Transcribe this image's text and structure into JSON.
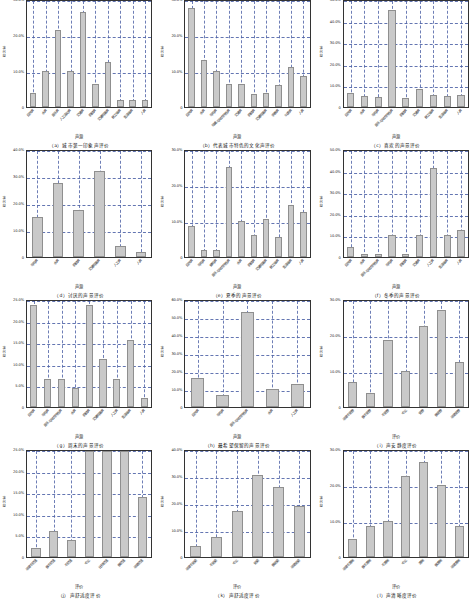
{
  "figure": {
    "bar_color": "#c9c9c9",
    "grid_color": "#4a5fa5",
    "axis_color": "#333333"
  },
  "chart_data": [
    {
      "type": "bar",
      "panel": "a",
      "title": "（a）城市第一印象声评价",
      "xlabel": "声源",
      "ylabel": "百分率",
      "ylim": [
        0,
        30
      ],
      "yticks": [
        0,
        10,
        20,
        30
      ],
      "ytick_labels": [
        "0",
        "10.0%",
        "20.0%",
        "30.0%"
      ],
      "grid": true,
      "categories": [
        "自然声",
        "水声",
        "音乐声",
        "人工活动声",
        "交通声",
        "机械声",
        "交通鸣笛声",
        "施工噪声",
        "生活噪声",
        "人声"
      ],
      "values": [
        4.0,
        10.0,
        21.5,
        10.0,
        26.5,
        6.5,
        12.5,
        2.0,
        2.0,
        2.0
      ]
    },
    {
      "type": "bar",
      "panel": "b",
      "title": "（b）代表城市特色的文化声评价",
      "xlabel": "声源",
      "ylabel": "百分率",
      "ylim": [
        0,
        30
      ],
      "yticks": [
        0,
        10,
        20,
        30
      ],
      "ytick_labels": [
        "0",
        "10.0%",
        "20.0%",
        "30.0%"
      ],
      "grid": true,
      "categories": [
        "自然声",
        "水声",
        "鸟鸣声",
        "戏曲与地方特色声",
        "交通声",
        "机械声",
        "交通鸣笛声",
        "宗教声",
        "叫卖声",
        "人声"
      ],
      "values": [
        27.5,
        13.0,
        10.0,
        6.5,
        6.5,
        3.5,
        4.0,
        6.0,
        11.0,
        8.5
      ]
    },
    {
      "type": "bar",
      "panel": "c",
      "title": "（c）喜欢的声景评价",
      "xlabel": "声源",
      "ylabel": "百分率",
      "ylim": [
        0,
        50
      ],
      "yticks": [
        0,
        10,
        20,
        30,
        40,
        50
      ],
      "ytick_labels": [
        "0",
        "10.0%",
        "20.0%",
        "30.0%",
        "40.0%",
        "50.0%"
      ],
      "grid": true,
      "categories": [
        "自然声",
        "水声",
        "鸟鸣声",
        "音乐与地方特色声",
        "机械声",
        "交通声",
        "施工噪声",
        "生活噪声",
        "人声"
      ],
      "values": [
        6.5,
        5.0,
        4.5,
        45.0,
        4.0,
        8.5,
        5.5,
        5.0,
        5.5
      ]
    },
    {
      "type": "bar",
      "panel": "d",
      "title": "（d）讨厌的声景评价",
      "xlabel": "声源",
      "ylabel": "百分率",
      "ylim": [
        0,
        40
      ],
      "yticks": [
        0,
        10,
        20,
        30,
        40
      ],
      "ytick_labels": [
        "0",
        "10.0%",
        "20.0%",
        "30.0%",
        "40.0%"
      ],
      "grid": true,
      "categories": [
        "鸟鸣声",
        "水声",
        "机械声",
        "交通鸣笛声",
        "人工声",
        "人声"
      ],
      "values": [
        15.0,
        27.5,
        17.5,
        32.0,
        4.0,
        2.0
      ]
    },
    {
      "type": "bar",
      "panel": "e",
      "title": "（e）夏季的声景评价",
      "xlabel": "声源",
      "ylabel": "百分率",
      "ylim": [
        0,
        30
      ],
      "yticks": [
        0,
        10,
        20,
        30
      ],
      "ytick_labels": [
        "0",
        "10.0%",
        "20.0%",
        "30.0%"
      ],
      "grid": true,
      "categories": [
        "自然声",
        "鸟鸣声",
        "蝉鸣声",
        "音乐与地方特色声",
        "水声",
        "机械声",
        "交通鸣笛声",
        "施工噪声",
        "生活噪声",
        "人声"
      ],
      "values": [
        8.5,
        2.0,
        2.0,
        25.0,
        10.0,
        6.0,
        10.5,
        5.5,
        14.5,
        12.5
      ]
    },
    {
      "type": "bar",
      "panel": "f",
      "title": "（f）冬季的声景评价",
      "xlabel": "声源",
      "ylabel": "百分率",
      "ylim": [
        0,
        50
      ],
      "yticks": [
        0,
        10,
        20,
        30,
        40,
        50
      ],
      "ytick_labels": [
        "0",
        "10.0%",
        "20.0%",
        "30.0%",
        "40.0%",
        "50.0%"
      ],
      "grid": true,
      "categories": [
        "自然声",
        "水声",
        "音乐与地方特色声",
        "鸟鸣声",
        "机械声",
        "交通声",
        "人工声",
        "生活噪声",
        "人声"
      ],
      "values": [
        4.5,
        1.5,
        1.5,
        10.0,
        1.5,
        10.0,
        41.0,
        10.0,
        12.5
      ]
    },
    {
      "type": "bar",
      "panel": "g",
      "title": "（g）周末的声景评价",
      "xlabel": "声源",
      "ylabel": "百分率",
      "ylim": [
        0,
        25
      ],
      "yticks": [
        0,
        5,
        10,
        15,
        20,
        25
      ],
      "ytick_labels": [
        "0",
        "5.0%",
        "10.0%",
        "15.0%",
        "20.0%",
        "25.0%"
      ],
      "grid": true,
      "categories": [
        "自然声",
        "鸟鸣声",
        "音乐与地方特色声",
        "水声",
        "机械声",
        "交通鸣笛声",
        "人工声",
        "生活噪声",
        "人声"
      ],
      "values": [
        23.5,
        6.5,
        6.5,
        4.5,
        23.5,
        11.0,
        6.5,
        15.5,
        2.0
      ]
    },
    {
      "type": "bar",
      "panel": "h",
      "title": "（h）最希望保留的声景评价",
      "xlabel": "声源",
      "ylabel": "百分率",
      "ylim": [
        0,
        60
      ],
      "yticks": [
        0,
        10,
        20,
        30,
        40,
        50,
        60
      ],
      "ytick_labels": [
        "0",
        "10.0%",
        "20.0%",
        "30.0%",
        "40.0%",
        "50.0%",
        "60.0%"
      ],
      "grid": true,
      "categories": [
        "自然声",
        "鸟鸣声",
        "音乐与地方特色声",
        "水声",
        "人工声"
      ],
      "values": [
        16.0,
        6.5,
        53.0,
        10.0,
        13.0
      ]
    },
    {
      "type": "bar",
      "panel": "i",
      "title": "（i）声安静度评价",
      "xlabel": "评价",
      "ylabel": "百分率",
      "ylim": [
        0,
        30
      ],
      "yticks": [
        0,
        10,
        20,
        30
      ],
      "ytick_labels": [
        "0",
        "10.0%",
        "20.0%",
        "30.0%"
      ],
      "grid": true,
      "categories": [
        "非常不安静",
        "很不安静",
        "不安静",
        "中立",
        "安静",
        "很安静",
        "非常安静"
      ],
      "values": [
        7.0,
        4.0,
        18.5,
        10.0,
        22.5,
        27.0,
        12.5
      ]
    },
    {
      "type": "bar",
      "panel": "j",
      "title": "（j）声舒适度评价",
      "xlabel": "评价",
      "ylabel": "百分率",
      "ylim": [
        0,
        25
      ],
      "yticks": [
        0,
        5,
        10,
        15,
        20,
        25
      ],
      "ytick_labels": [
        "0",
        "5.0%",
        "10.0%",
        "15.0%",
        "20.0%",
        "25.0%"
      ],
      "grid": true,
      "categories": [
        "非常不舒适",
        "很不舒适",
        "不舒适",
        "中立",
        "比较舒适",
        "很舒适",
        "非常舒适"
      ],
      "values": [
        2.0,
        6.0,
        4.0,
        24.5,
        24.5,
        24.5,
        14.0
      ]
    },
    {
      "type": "bar",
      "panel": "k",
      "title": "（k）声舒适度评价",
      "xlabel": "评价",
      "ylabel": "百分率",
      "ylim": [
        0,
        40
      ],
      "yticks": [
        0,
        10,
        20,
        30,
        40
      ],
      "ytick_labels": [
        "0",
        "10.0%",
        "20.0%",
        "30.0%",
        "40.0%"
      ],
      "grid": true,
      "categories": [
        "非常不协调",
        "不协调",
        "中立",
        "协调",
        "很协调",
        "非常协调"
      ],
      "values": [
        4.0,
        7.5,
        17.0,
        30.5,
        26.0,
        19.0
      ]
    },
    {
      "type": "bar",
      "panel": "l",
      "title": "（l）声清晰度评价",
      "xlabel": "评价",
      "ylabel": "百分率",
      "ylim": [
        0,
        30
      ],
      "yticks": [
        0,
        10,
        20,
        30
      ],
      "ytick_labels": [
        "0",
        "10.0%",
        "20.0%",
        "30.0%"
      ],
      "grid": true,
      "categories": [
        "非常不清晰",
        "很不清晰",
        "不清晰",
        "中立",
        "清晰",
        "很清晰",
        "非常清晰"
      ],
      "values": [
        5.0,
        8.5,
        10.0,
        22.5,
        26.5,
        20.0,
        8.5
      ]
    }
  ]
}
